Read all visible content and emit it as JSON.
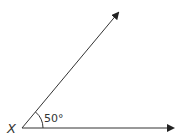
{
  "diagram": {
    "type": "angle",
    "vertex_label": "X",
    "angle_label": "50°",
    "angle_degrees": 50,
    "line_color": "#333333",
    "background": "#ffffff"
  }
}
